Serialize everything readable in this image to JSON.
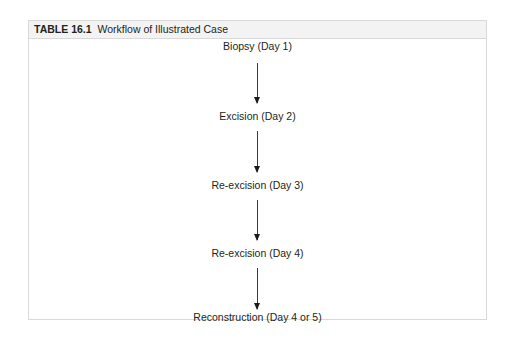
{
  "table": {
    "label": "TABLE 16.1",
    "title": "Workflow of Illustrated Case"
  },
  "workflow": {
    "steps": [
      {
        "label": "Biopsy (Day 1)"
      },
      {
        "label": "Excision (Day 2)"
      },
      {
        "label": "Re-excision (Day 3)"
      },
      {
        "label": "Re-excision (Day 4)"
      },
      {
        "label": "Reconstruction (Day 4 or 5)"
      }
    ],
    "connector_icon": "down-arrow-icon"
  },
  "colors": {
    "border": "#d9d9d9",
    "header_background": "#f3f3f3",
    "text": "#231f20",
    "arrow": "#1a1a1a"
  }
}
